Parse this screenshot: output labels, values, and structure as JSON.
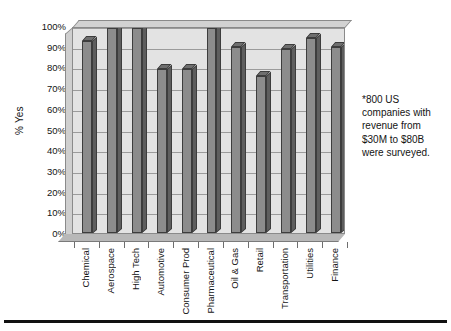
{
  "chart_data": {
    "type": "bar",
    "title": "",
    "subtitle": "",
    "xlabel": "",
    "ylabel": "% Yes",
    "ylim": [
      0,
      100
    ],
    "grid": true,
    "legend": false,
    "style": "3d-column-grayscale",
    "categories": [
      "Chemical",
      "Aerospace",
      "High Tech",
      "Automotive",
      "Consumer Prod",
      "Pharmaceutical",
      "Oil & Gas",
      "Retail",
      "Transportation",
      "Utilities",
      "Finance"
    ],
    "values": [
      93,
      99,
      99,
      79,
      79,
      99,
      90,
      76,
      89,
      94,
      90
    ],
    "y_ticks": [
      "0%",
      "10%",
      "20%",
      "30%",
      "40%",
      "50%",
      "60%",
      "70%",
      "80%",
      "90%",
      "100%"
    ],
    "y_tick_values": [
      0,
      10,
      20,
      30,
      40,
      50,
      60,
      70,
      80,
      90,
      100
    ],
    "annotation": "*800 US companies with revenue from $30M to $80B were surveyed.",
    "colors": {
      "bar_front": "#8c8c8c",
      "bar_top": "#6f6f6f",
      "bar_side": "#5e5e5e",
      "bar_outline": "#3d3d3d",
      "plot_background": "#e3e3e3",
      "gridline": "#9b9b9b",
      "axis_text": "#141414",
      "rule": "#111111"
    }
  }
}
